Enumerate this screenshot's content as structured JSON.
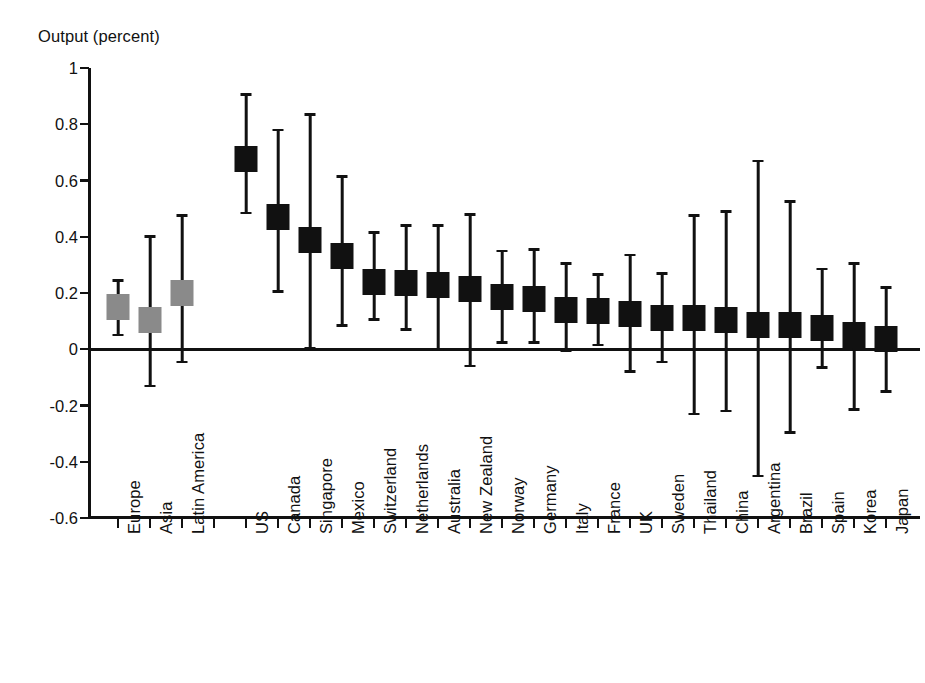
{
  "chart_data": {
    "type": "scatter",
    "title": "",
    "ylabel": "Output (percent)",
    "xlabel": "",
    "ylim": [
      -0.6,
      1
    ],
    "ytick_labels": [
      "1",
      "0.8",
      "0.6",
      "0.4",
      "0.2",
      "0",
      "-0.2",
      "-0.4",
      "-0.6"
    ],
    "ytick_values": [
      1,
      0.8,
      0.6,
      0.4,
      0.2,
      0,
      -0.2,
      -0.4,
      -0.6
    ],
    "grid": false,
    "legend": "none",
    "zero_line": true,
    "marker_style": "square with 90% confidence interval whiskers",
    "group_colors": {
      "region": "#8a8a8a",
      "country": "#111111"
    },
    "categories": [
      "Europe",
      "Asia",
      "Latin America",
      "",
      "US",
      "Canada",
      "Singapore",
      "Mexico",
      "Switzerland",
      "Netherlands",
      "Australia",
      "New Zealand",
      "Norway",
      "Germany",
      "Italy",
      "France",
      "UK",
      "Sweden",
      "Thailand",
      "China",
      "Argentina",
      "Brazil",
      "Spain",
      "Korea",
      "Japan"
    ],
    "points": [
      {
        "label": "Europe",
        "slot": 0,
        "group": "region",
        "value": 0.15,
        "low": 0.05,
        "high": 0.245
      },
      {
        "label": "Asia",
        "slot": 1,
        "group": "region",
        "value": 0.105,
        "low": -0.13,
        "high": 0.4
      },
      {
        "label": "Latin America",
        "slot": 2,
        "group": "region",
        "value": 0.2,
        "low": -0.045,
        "high": 0.475
      },
      {
        "label": "US",
        "slot": 4,
        "group": "country",
        "value": 0.675,
        "low": 0.485,
        "high": 0.905
      },
      {
        "label": "Canada",
        "slot": 5,
        "group": "country",
        "value": 0.47,
        "low": 0.205,
        "high": 0.78
      },
      {
        "label": "Singapore",
        "slot": 6,
        "group": "country",
        "value": 0.39,
        "low": 0.005,
        "high": 0.835
      },
      {
        "label": "Mexico",
        "slot": 7,
        "group": "country",
        "value": 0.33,
        "low": 0.085,
        "high": 0.615
      },
      {
        "label": "Switzerland",
        "slot": 8,
        "group": "country",
        "value": 0.24,
        "low": 0.105,
        "high": 0.415
      },
      {
        "label": "Netherlands",
        "slot": 9,
        "group": "country",
        "value": 0.235,
        "low": 0.07,
        "high": 0.44
      },
      {
        "label": "Australia",
        "slot": 10,
        "group": "country",
        "value": 0.23,
        "low": 0.0,
        "high": 0.44
      },
      {
        "label": "New Zealand",
        "slot": 11,
        "group": "country",
        "value": 0.215,
        "low": -0.06,
        "high": 0.48
      },
      {
        "label": "Norway",
        "slot": 12,
        "group": "country",
        "value": 0.185,
        "low": 0.025,
        "high": 0.35
      },
      {
        "label": "Germany",
        "slot": 13,
        "group": "country",
        "value": 0.18,
        "low": 0.025,
        "high": 0.355
      },
      {
        "label": "Italy",
        "slot": 14,
        "group": "country",
        "value": 0.14,
        "low": -0.005,
        "high": 0.305
      },
      {
        "label": "France",
        "slot": 15,
        "group": "country",
        "value": 0.135,
        "low": 0.015,
        "high": 0.265
      },
      {
        "label": "UK",
        "slot": 16,
        "group": "country",
        "value": 0.125,
        "low": -0.08,
        "high": 0.335
      },
      {
        "label": "Sweden",
        "slot": 17,
        "group": "country",
        "value": 0.11,
        "low": -0.045,
        "high": 0.27
      },
      {
        "label": "Thailand",
        "slot": 18,
        "group": "country",
        "value": 0.11,
        "low": -0.23,
        "high": 0.475
      },
      {
        "label": "China",
        "slot": 19,
        "group": "country",
        "value": 0.105,
        "low": -0.22,
        "high": 0.49
      },
      {
        "label": "Argentina",
        "slot": 20,
        "group": "country",
        "value": 0.085,
        "low": -0.45,
        "high": 0.67
      },
      {
        "label": "Brazil",
        "slot": 21,
        "group": "country",
        "value": 0.085,
        "low": -0.295,
        "high": 0.525
      },
      {
        "label": "Spain",
        "slot": 22,
        "group": "country",
        "value": 0.075,
        "low": -0.065,
        "high": 0.285
      },
      {
        "label": "Korea",
        "slot": 23,
        "group": "country",
        "value": 0.05,
        "low": -0.215,
        "high": 0.305
      },
      {
        "label": "Japan",
        "slot": 24,
        "group": "country",
        "value": 0.035,
        "low": -0.15,
        "high": 0.22
      }
    ]
  }
}
